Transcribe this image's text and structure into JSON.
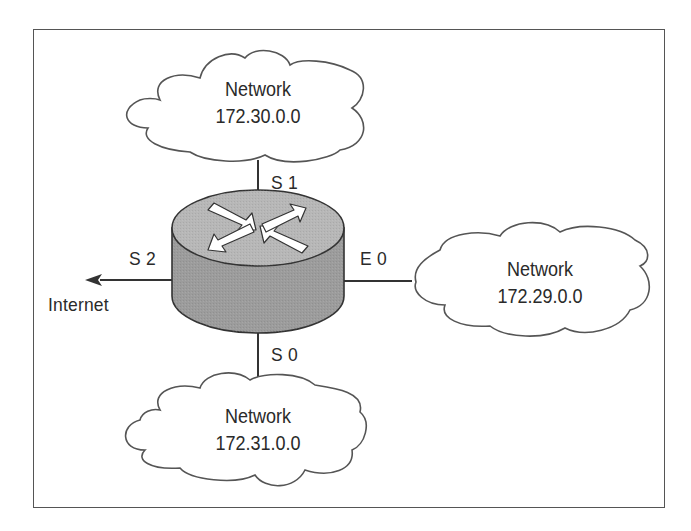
{
  "diagram": {
    "colors": {
      "line": "#333333",
      "frame": "#555555",
      "router_top": "#b7b7b7",
      "router_body": "#9c9c9c",
      "arrow_fill": "#ffffff",
      "text": "#2a2a2a"
    },
    "router": {
      "icon": "router-icon",
      "interfaces": {
        "s1": "S 1",
        "s0": "S 0",
        "s2": "S 2",
        "e0": "E 0"
      }
    },
    "clouds": {
      "top": {
        "title": "Network",
        "address": "172.30.0.0",
        "interface": "S 1"
      },
      "right": {
        "title": "Network",
        "address": "172.29.0.0",
        "interface": "E 0"
      },
      "bottom": {
        "title": "Network",
        "address": "172.31.0.0",
        "interface": "S 0"
      }
    },
    "internet": {
      "label": "Internet",
      "interface": "S 2"
    }
  }
}
